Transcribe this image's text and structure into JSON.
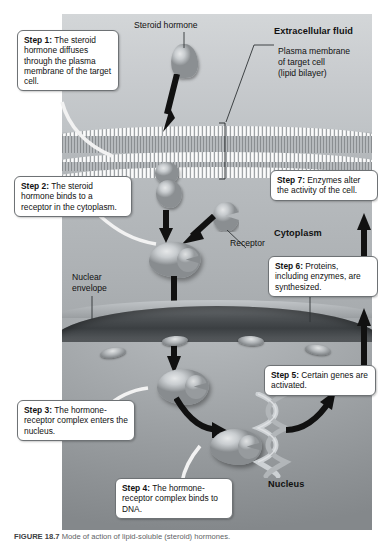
{
  "figure": {
    "caption_number": "FIGURE 18.7",
    "caption_text": "Mode of action of lipid-soluble (steroid) hormones."
  },
  "zones": [
    {
      "id": "extracellular",
      "label": "Extracellular fluid"
    },
    {
      "id": "cytoplasm",
      "label": "Cytoplasm"
    },
    {
      "id": "nucleus",
      "label": "Nucleus"
    }
  ],
  "labels": [
    {
      "id": "steroid-hormone",
      "text": "Steroid hormone"
    },
    {
      "id": "plasma-membrane-line1",
      "text": "Plasma membrane"
    },
    {
      "id": "plasma-membrane-line2",
      "text": "of target cell"
    },
    {
      "id": "plasma-membrane-line3",
      "text": "(lipid bilayer)"
    },
    {
      "id": "receptor",
      "text": "Receptor"
    },
    {
      "id": "nuclear-envelope-line1",
      "text": "Nuclear"
    },
    {
      "id": "nuclear-envelope-line2",
      "text": "envelope"
    },
    {
      "id": "nuclear-pore-line1",
      "text": "Nuclear"
    },
    {
      "id": "nuclear-pore-line2",
      "text": "pore"
    }
  ],
  "steps": [
    {
      "id": "step-1",
      "number": "Step 1:",
      "text": "The steroid hormone diffuses through the plasma membrane of the target cell."
    },
    {
      "id": "step-2",
      "number": "Step 2:",
      "text": "The steroid hormone binds to a receptor in the cytoplasm."
    },
    {
      "id": "step-3",
      "number": "Step 3:",
      "text": "The hormone-receptor complex enters the nucleus."
    },
    {
      "id": "step-4",
      "number": "Step 4:",
      "text": "The hormone-receptor complex binds to DNA."
    },
    {
      "id": "step-5",
      "number": "Step 5:",
      "text": "Certain genes are activated."
    },
    {
      "id": "step-6",
      "number": "Step 6:",
      "text": "Proteins, including enzymes, are synthesized."
    },
    {
      "id": "step-7",
      "number": "Step 7:",
      "text": "Enzymes alter the activity of the cell."
    }
  ],
  "colors": {
    "page_background": "#ffffff",
    "scene_light": "#d3d6d8",
    "scene_mid": "#aeb2b5",
    "scene_dark": "#84888b",
    "nuclear_envelope": "#3b3f42",
    "callout_border": "#6e7275",
    "callout_fill": "#ffffff",
    "arrow": "#111111",
    "text": "#111111"
  }
}
